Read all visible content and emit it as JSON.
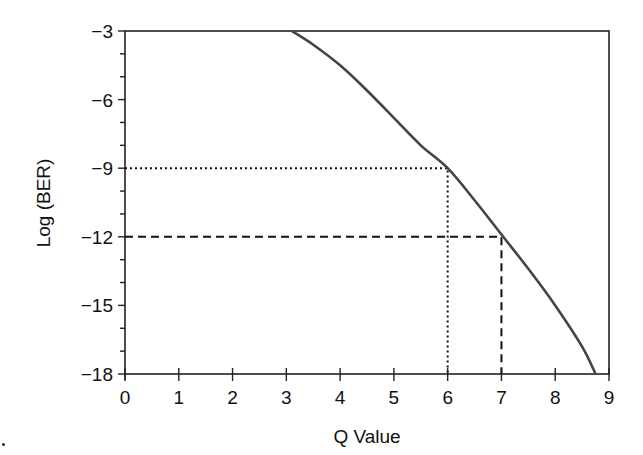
{
  "chart_data": {
    "type": "line",
    "title": "",
    "xlabel": "Q Value",
    "ylabel": "Log (BER)",
    "xlim": [
      0,
      9
    ],
    "ylim": [
      -18,
      -3
    ],
    "x_ticks": [
      0,
      1,
      2,
      3,
      4,
      5,
      6,
      7,
      8,
      9
    ],
    "y_ticks": [
      -3,
      -6,
      -9,
      -12,
      -15,
      -18
    ],
    "x_tick_labels": [
      "0",
      "1",
      "2",
      "3",
      "4",
      "5",
      "6",
      "7",
      "8",
      "9"
    ],
    "y_tick_labels": [
      "−3",
      "−6",
      "−9",
      "−12",
      "−15",
      "−18"
    ],
    "grid": false,
    "legend": null,
    "series": [
      {
        "name": "BER vs Q",
        "style": "solid",
        "color": "#444444",
        "x": [
          3.1,
          3.5,
          4.0,
          4.5,
          5.0,
          5.5,
          6.0,
          6.5,
          7.0,
          7.5,
          8.0,
          8.5,
          8.75
        ],
        "y": [
          -3.0,
          -3.6,
          -4.5,
          -5.6,
          -6.8,
          -8.0,
          -9.0,
          -10.4,
          -11.9,
          -13.4,
          -15.0,
          -16.8,
          -18.0
        ]
      }
    ],
    "annotations": [
      {
        "name": "Q=6 reference",
        "style": "dotted",
        "x": 6,
        "y": -9
      },
      {
        "name": "Q=7 reference",
        "style": "dashed",
        "x": 7,
        "y": -12
      }
    ]
  }
}
